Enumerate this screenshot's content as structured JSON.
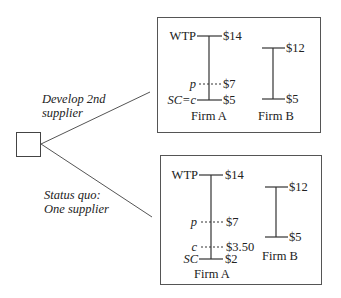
{
  "decision_node": {
    "shape": "square"
  },
  "branches": [
    {
      "label_line1": "Develop 2nd",
      "label_line2": "supplier"
    },
    {
      "label_line1": "Status quo:",
      "label_line2": "One supplier"
    }
  ],
  "scenarios": [
    {
      "name": "develop-2nd-supplier",
      "firm_a": {
        "label": "Firm A",
        "wtp_label": "WTP",
        "wtp_value": "$14",
        "p_label": "p",
        "p_value": "$7",
        "sc_label": "SC=c",
        "sc_value": "$5"
      },
      "firm_b": {
        "label": "Firm B",
        "top_value": "$12",
        "bottom_value": "$5"
      }
    },
    {
      "name": "status-quo",
      "firm_a": {
        "label": "Firm A",
        "wtp_label": "WTP",
        "wtp_value": "$14",
        "p_label": "p",
        "p_value": "$7",
        "c_label": "c",
        "c_value": "$3.50",
        "sc_label": "SC",
        "sc_value": "$2"
      },
      "firm_b": {
        "label": "Firm B",
        "top_value": "$12",
        "bottom_value": "$5"
      }
    }
  ],
  "colors": {
    "line": "#333333",
    "box": "#555555"
  }
}
